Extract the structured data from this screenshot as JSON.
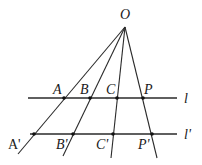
{
  "diagram": {
    "apex": {
      "label": "O",
      "x": 125,
      "y": 27,
      "label_x": 120,
      "label_y": 19
    },
    "lines": {
      "l": {
        "label": "l",
        "y": 98,
        "x1": 28,
        "x2": 177,
        "label_x": 184,
        "label_y": 103
      },
      "l_prime": {
        "label": "l'",
        "y": 134,
        "x1": 30,
        "x2": 177,
        "label_x": 184,
        "label_y": 139
      }
    },
    "rays": [
      {
        "name": "A",
        "end_x": 18,
        "end_y": 154
      },
      {
        "name": "B",
        "end_x": 63,
        "end_y": 156
      },
      {
        "name": "C",
        "end_x": 111,
        "end_y": 158
      },
      {
        "name": "P",
        "end_x": 157,
        "end_y": 158
      }
    ],
    "points_on_l": [
      {
        "label": "A",
        "x": 64,
        "y": 98,
        "label_x": 53,
        "label_y": 94
      },
      {
        "label": "B",
        "x": 90,
        "y": 98,
        "label_x": 80,
        "label_y": 94
      },
      {
        "label": "C",
        "x": 117,
        "y": 98,
        "label_x": 106,
        "label_y": 94
      },
      {
        "label": "P",
        "x": 143,
        "y": 98,
        "label_x": 144,
        "label_y": 94
      }
    ],
    "points_on_l_prime": [
      {
        "label": "A'",
        "x": 34,
        "y": 134,
        "label_x": 8,
        "label_y": 149
      },
      {
        "label": "B'",
        "x": 73,
        "y": 134,
        "label_x": 56,
        "label_y": 149
      },
      {
        "label": "C'",
        "x": 113,
        "y": 134,
        "label_x": 96,
        "label_y": 149
      },
      {
        "label": "P'",
        "x": 152,
        "y": 134,
        "label_x": 138,
        "label_y": 149
      }
    ]
  }
}
